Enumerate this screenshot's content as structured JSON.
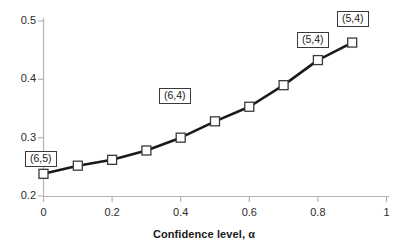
{
  "chart_data": {
    "type": "line",
    "title": "",
    "subtitle": "",
    "xlabel": "Confidence level, α",
    "ylabel": "",
    "xlim": [
      0,
      1
    ],
    "ylim": [
      0.2,
      0.5
    ],
    "grid": false,
    "legend": false,
    "legend_position": "none",
    "marker": "open-square",
    "line_color": "#1a1a1a",
    "marker_face_color": "#ffffff",
    "marker_edge_color": "#3a3a3a",
    "x": [
      0,
      0.1,
      0.2,
      0.3,
      0.4,
      0.5,
      0.6,
      0.7,
      0.8,
      0.9
    ],
    "values": [
      0.238,
      0.252,
      0.262,
      0.278,
      0.3,
      0.328,
      0.353,
      0.39,
      0.433,
      0.463
    ],
    "series": [
      {
        "name": "",
        "values": [
          0.238,
          0.252,
          0.262,
          0.278,
          0.3,
          0.328,
          0.353,
          0.39,
          0.433,
          0.463
        ]
      }
    ],
    "x_tick_labels": [
      "0",
      "0.2",
      "0.4",
      "0.6",
      "0.8",
      "1"
    ],
    "x_tick_values": [
      0,
      0.2,
      0.4,
      0.6,
      0.8,
      1
    ],
    "y_tick_labels": [
      "0.2",
      "0.3",
      "0.4",
      "0.5"
    ],
    "y_tick_values": [
      0.2,
      0.3,
      0.4,
      0.5
    ],
    "annotations": [
      {
        "text": "(6,5)",
        "anchor_x": 0.0,
        "anchor_y": 0.238
      },
      {
        "text": "(6,4)",
        "anchor_x": 0.4,
        "anchor_y": 0.3
      },
      {
        "text": "(5,4)",
        "anchor_x": 0.8,
        "anchor_y": 0.433
      },
      {
        "text": "(5,4)",
        "anchor_x": 0.9,
        "anchor_y": 0.463
      }
    ]
  },
  "axes": {
    "x_title": "Confidence level, α",
    "y_ticks": [
      "0.5",
      "0.4",
      "0.3",
      "0.2"
    ],
    "x_ticks": [
      "0",
      "0.2",
      "0.4",
      "0.6",
      "0.8",
      "1"
    ]
  },
  "labels": {
    "a": "(6,5)",
    "b": "(6,4)",
    "c": "(5,4)",
    "d": "(5,4)"
  },
  "colors": {
    "line": "#1a1a1a",
    "axis": "#b4b4b4",
    "marker_edge": "#3a3a3a",
    "text": "#2b2b2b"
  }
}
